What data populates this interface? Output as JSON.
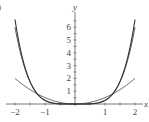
{
  "panel_label": ")",
  "chart_data": {
    "type": "line",
    "title": "",
    "xlabel": "x",
    "ylabel": "y",
    "xlim": [
      -2,
      2
    ],
    "ylim": [
      0,
      6.5
    ],
    "x_ticks": [
      "-2",
      "-1",
      "1",
      "2"
    ],
    "y_ticks": [
      "1",
      "2",
      "3",
      "4",
      "5",
      "6"
    ],
    "grid": false,
    "series": [
      {
        "name": "curve-outer",
        "x": [
          -2,
          -1.5,
          -1,
          -0.5,
          0,
          0.5,
          1,
          1.5,
          2
        ],
        "values": [
          6.6,
          2.4,
          0.55,
          0.05,
          0,
          0.05,
          0.55,
          2.4,
          6.6
        ]
      },
      {
        "name": "curve-middle",
        "x": [
          -2,
          -1.5,
          -1,
          -0.5,
          0,
          0.5,
          1,
          1.5,
          2
        ],
        "values": [
          6.0,
          2.1,
          0.5,
          0.04,
          0,
          0.04,
          0.5,
          2.1,
          6.0
        ]
      },
      {
        "name": "curve-flat",
        "x": [
          -2,
          -1.5,
          -1,
          -0.5,
          0,
          0.5,
          1,
          1.5,
          2
        ],
        "values": [
          2.0,
          1.1,
          0.5,
          0.12,
          0,
          0.12,
          0.5,
          1.1,
          2.0
        ]
      }
    ]
  }
}
